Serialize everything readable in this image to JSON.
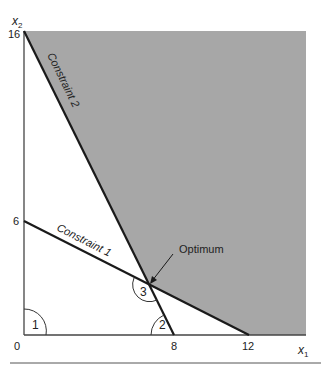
{
  "figure": {
    "type": "linear-programming-feasible-region",
    "axes": {
      "x_label": "x",
      "x_sub": "1",
      "y_label": "x",
      "y_sub": "2",
      "x_ticks": [
        "0",
        "8",
        "12"
      ],
      "y_ticks": [
        "6",
        "16"
      ],
      "origin_label": "0"
    },
    "constraints": [
      {
        "label": "Constraint 1",
        "x_intercept": 12,
        "y_intercept": 6
      },
      {
        "label": "Constraint 2",
        "x_intercept": 8,
        "y_intercept": 16
      }
    ],
    "annotations": {
      "optimum_label": "Optimum",
      "optimum_point": [
        6.67,
        2.67
      ],
      "angle_labels": [
        "1",
        "2",
        "3"
      ]
    },
    "colors": {
      "feasible_region": "#a7a7a7",
      "lines": "#1a1a1a",
      "background": "#ffffff"
    }
  }
}
